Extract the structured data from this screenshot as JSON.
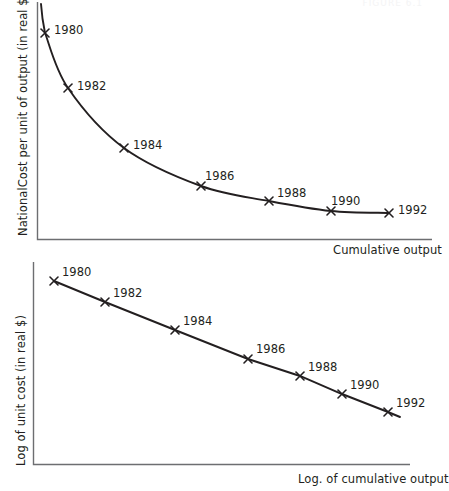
{
  "figure": {
    "faint_header_text": "FIGURE 6.1",
    "background_color": "#ffffff",
    "ink_color": "#231f20",
    "axis_color": "#6d6e71"
  },
  "charts": [
    {
      "id": "unit-cost-vs-cumulative-output",
      "ylabel": "NationalCost per unit of output (in real $)",
      "xlabel": "Cumulative output",
      "labels": [
        "1980",
        "1982",
        "1984",
        "1986",
        "1988",
        "1990",
        "1992"
      ]
    },
    {
      "id": "log-unit-cost-vs-log-cumulative-output",
      "ylabel": "Log of unit cost (in real $)",
      "xlabel": "Log. of cumulative output",
      "labels": [
        "1980",
        "1982",
        "1984",
        "1986",
        "1988",
        "1990",
        "1992"
      ]
    }
  ],
  "chart_data": [
    {
      "type": "line",
      "title": "",
      "subtitle": "",
      "xlabel": "Cumulative output",
      "ylabel": "NationalCost per unit of output (in real $)",
      "grid": false,
      "legend": "none",
      "axis_ticks": "none",
      "annotations": [
        "1980",
        "1982",
        "1984",
        "1986",
        "1988",
        "1990",
        "1992"
      ],
      "x": [
        1980,
        1982,
        1984,
        1986,
        1988,
        1990,
        1992
      ],
      "xlim": [
        1979.2,
        1993.0
      ],
      "ylim": [
        0,
        100
      ],
      "series": [
        {
          "name": "Cost per unit of output (in real $)",
          "values": [
            88,
            61,
            37,
            23,
            16,
            11.5,
            10.5
          ],
          "point_px": [
            [
              45,
              33
            ],
            [
              68,
              88
            ],
            [
              124,
              148
            ],
            [
              201,
              186
            ],
            [
              269,
              201
            ],
            [
              331,
              211
            ],
            [
              389,
              213
            ]
          ],
          "label_px": [
            [
              54,
              34
            ],
            [
              77,
              90
            ],
            [
              133,
              149
            ],
            [
              205,
              180
            ],
            [
              277,
              197
            ],
            [
              331,
              205
            ],
            [
              398,
              214
            ]
          ]
        }
      ]
    },
    {
      "type": "line",
      "title": "",
      "subtitle": "",
      "xlabel": "Log. of cumulative output",
      "ylabel": "Log of unit cost (in real $)",
      "grid": false,
      "legend": "none",
      "axis_ticks": "none",
      "annotations": [
        "1980",
        "1982",
        "1984",
        "1986",
        "1988",
        "1990",
        "1992"
      ],
      "x": [
        1980,
        1982,
        1984,
        1986,
        1988,
        1990,
        1992
      ],
      "xlim": [
        1979.4,
        1993.0
      ],
      "ylim": [
        0,
        100
      ],
      "series": [
        {
          "name": "Log of unit cost (in real $)",
          "values": [
            92,
            76,
            55,
            33,
            20,
            7,
            -10
          ],
          "point_px": [
            [
              54,
              281
            ],
            [
              105,
              302
            ],
            [
              175,
              330
            ],
            [
              248,
              359
            ],
            [
              300,
              376
            ],
            [
              342,
              394
            ],
            [
              388,
              412
            ]
          ],
          "label_px": [
            [
              62,
              276
            ],
            [
              113,
              297
            ],
            [
              183,
              325
            ],
            [
              256,
              353
            ],
            [
              308,
              371
            ],
            [
              350,
              389
            ],
            [
              396,
              407
            ]
          ]
        }
      ]
    }
  ]
}
